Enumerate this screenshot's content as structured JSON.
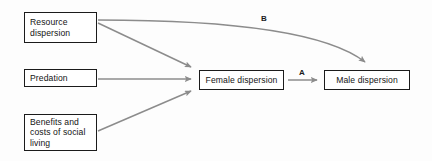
{
  "diagram": {
    "type": "flow-diagram",
    "background_color": "#fdfdfd",
    "node_border_color": "#1b1b1b",
    "node_fill_color": "#ffffff",
    "edge_color": "#8c8c8c",
    "text_color": "#141414",
    "nodes": [
      {
        "id": "resource-dispersion",
        "lines": [
          "Resource",
          "dispersion"
        ],
        "align": "left"
      },
      {
        "id": "predation",
        "lines": [
          "Predation"
        ],
        "align": "left"
      },
      {
        "id": "benefits-costs-social-living",
        "lines": [
          "Benefits and",
          "costs of social",
          "living"
        ],
        "align": "left"
      },
      {
        "id": "female-dispersion",
        "lines": [
          "Female dispersion"
        ],
        "align": "center"
      },
      {
        "id": "male-dispersion",
        "lines": [
          "Male dispersion"
        ],
        "align": "center"
      }
    ],
    "edges": [
      {
        "id": "resource-to-female",
        "from": "resource-dispersion",
        "to": "female-dispersion",
        "label": "",
        "shape": "straight",
        "arrowhead": "end"
      },
      {
        "id": "predation-to-female",
        "from": "predation",
        "to": "female-dispersion",
        "label": "",
        "shape": "straight",
        "arrowhead": "end"
      },
      {
        "id": "benefits-to-female",
        "from": "benefits-costs-social-living",
        "to": "female-dispersion",
        "label": "",
        "shape": "straight",
        "arrowhead": "end"
      },
      {
        "id": "female-to-male",
        "from": "female-dispersion",
        "to": "male-dispersion",
        "label": "A",
        "shape": "straight",
        "arrowhead": "end"
      },
      {
        "id": "resource-to-male",
        "from": "resource-dispersion",
        "to": "male-dispersion",
        "label": "B",
        "shape": "curved",
        "arrowhead": "end"
      }
    ]
  }
}
